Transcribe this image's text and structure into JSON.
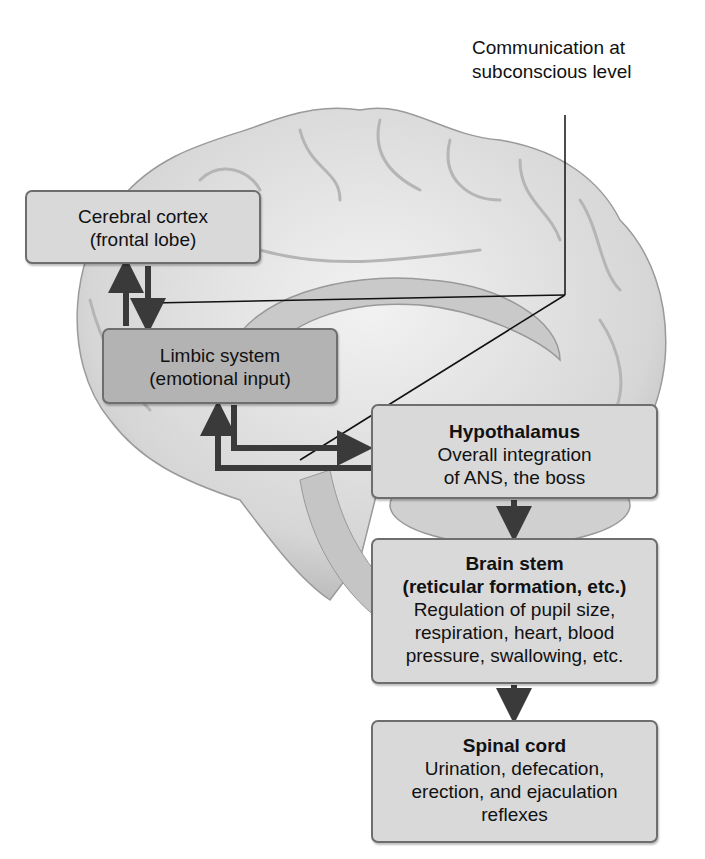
{
  "annotation": {
    "line1": "Communication at",
    "line2": "subconscious level"
  },
  "boxes": {
    "cortex": {
      "line1": "Cerebral cortex",
      "line2": "(frontal lobe)"
    },
    "limbic": {
      "line1": "Limbic system",
      "line2": "(emotional input)"
    },
    "hypothalamus": {
      "title": "Hypothalamus",
      "line1": "Overall integration",
      "line2": "of ANS, the boss"
    },
    "brainstem": {
      "title1": "Brain stem",
      "title2": "(reticular formation, etc.)",
      "line1": "Regulation of pupil size,",
      "line2": "respiration, heart, blood",
      "line3": "pressure, swallowing, etc."
    },
    "spinal": {
      "title": "Spinal cord",
      "line1": "Urination, defecation,",
      "line2": "erection, and ejaculation",
      "line3": "reflexes"
    }
  },
  "colors": {
    "box_light": "#d9d9d9",
    "box_dark": "#b3b3b3",
    "arrow": "#3a3a3a"
  }
}
